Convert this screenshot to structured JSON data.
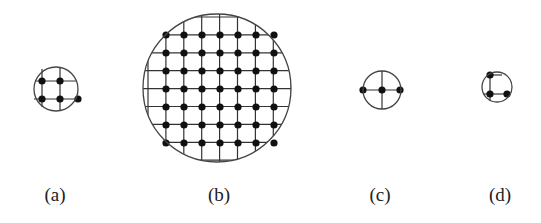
{
  "figure": {
    "panels": [
      {
        "id": "a",
        "label": "(a)",
        "circle": {
          "cx": 56,
          "cy": 89,
          "r": 22
        },
        "lines": [
          {
            "x1": 42,
            "y1": 69,
            "x2": 42,
            "y2": 107
          },
          {
            "x1": 60,
            "y1": 67,
            "x2": 60,
            "y2": 111
          },
          {
            "x1": 35,
            "y1": 81,
            "x2": 76,
            "y2": 81
          },
          {
            "x1": 34,
            "y1": 99,
            "x2": 78,
            "y2": 99
          }
        ],
        "dots": [
          [
            42,
            81
          ],
          [
            60,
            81
          ],
          [
            42,
            99
          ],
          [
            60,
            99
          ],
          [
            78,
            99
          ]
        ],
        "label_pos": {
          "x": 55,
          "y": 201
        }
      },
      {
        "id": "b",
        "label": "(b)",
        "circle": {
          "cx": 217,
          "cy": 88,
          "r": 74
        },
        "grid": {
          "x0": 148,
          "y0": 17,
          "step": 17.9,
          "count": 9
        },
        "dot_grid": {
          "x0": 166,
          "y0": 35,
          "step": 18,
          "cols": 7,
          "rows": 7
        },
        "label_pos": {
          "x": 219,
          "y": 201
        }
      },
      {
        "id": "c",
        "label": "(c)",
        "circle": {
          "cx": 382,
          "cy": 90,
          "r": 19
        },
        "lines": [
          {
            "x1": 363,
            "y1": 90,
            "x2": 401,
            "y2": 90
          },
          {
            "x1": 382,
            "y1": 71,
            "x2": 382,
            "y2": 109
          }
        ],
        "dots": [
          [
            363,
            90
          ],
          [
            382,
            90
          ],
          [
            400,
            90
          ]
        ],
        "label_pos": {
          "x": 380,
          "y": 201
        }
      },
      {
        "id": "d",
        "label": "(d)",
        "circle": {
          "cx": 497,
          "cy": 87,
          "r": 15
        },
        "lines": [
          {
            "x1": 490,
            "y1": 73,
            "x2": 490,
            "y2": 101
          },
          {
            "x1": 490,
            "y1": 75,
            "x2": 502,
            "y2": 75
          },
          {
            "x1": 483,
            "y1": 94,
            "x2": 509,
            "y2": 94
          }
        ],
        "dots": [
          [
            490,
            75
          ],
          [
            490,
            94
          ],
          [
            507,
            94
          ]
        ],
        "label_pos": {
          "x": 500,
          "y": 201
        }
      }
    ]
  },
  "labels": {
    "a": "(a)",
    "b": "(b)",
    "c": "(c)",
    "d": "(d)"
  },
  "colors": {
    "stroke": "#444444",
    "dot": "#111111",
    "background": "#ffffff"
  }
}
